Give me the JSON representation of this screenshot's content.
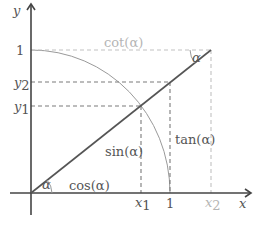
{
  "diagram": {
    "axes": {
      "x_label": "x",
      "y_label": "y"
    },
    "ticks": {
      "x": [
        {
          "label": "x",
          "sub": "1",
          "value": "x1"
        },
        {
          "label": "1",
          "sub": "",
          "value": "1"
        },
        {
          "label": "x",
          "sub": "2",
          "value": "x2"
        }
      ],
      "y": [
        {
          "label": "1",
          "sub": "",
          "value": "1"
        },
        {
          "label": "y",
          "sub": "2",
          "value": "y2"
        },
        {
          "label": "y",
          "sub": "1",
          "value": "y1"
        }
      ]
    },
    "labels": {
      "cot": "cot(α)",
      "tan": "tan(α)",
      "sin": "sin(α)",
      "cos": "cos(α)",
      "angle_origin": "α",
      "angle_top": "α"
    },
    "colors": {
      "axis": "#444444",
      "line": "#555555",
      "dashed": "#7a7a7a",
      "light": "#c2c2c2",
      "arc": "#9a9a9a"
    }
  }
}
